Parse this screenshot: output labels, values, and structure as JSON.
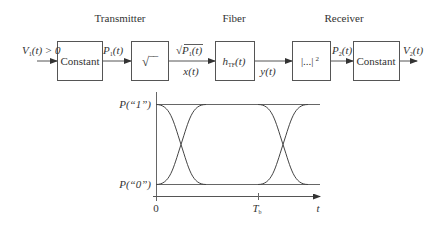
{
  "sections": {
    "transmitter": "Transmitter",
    "fiber": "Fiber",
    "receiver": "Receiver"
  },
  "blocks": [
    {
      "id": "tx-constant",
      "label": "Constant"
    },
    {
      "id": "sqrt",
      "label": "√‾‾"
    },
    {
      "id": "fiber-response",
      "label_main": "h",
      "label_sub": "TF",
      "label_arg": "(t)"
    },
    {
      "id": "square-law",
      "label": "|...|",
      "label_sup": "2"
    },
    {
      "id": "rx-constant",
      "label": "Constant"
    }
  ],
  "signals": {
    "input": {
      "main": "V",
      "sub": "1",
      "rest": "(t) > 0"
    },
    "p1": {
      "main": "P",
      "sub": "1",
      "rest": "(t)"
    },
    "sqrt_p1": {
      "prefix": "√",
      "main": "P",
      "sub": "1",
      "rest": "(t)"
    },
    "x": "x(t)",
    "y": "y(t)",
    "p2": {
      "main": "P",
      "sub": "2",
      "rest": "(t)"
    },
    "output": {
      "main": "V",
      "sub": "2",
      "rest": "(t)"
    }
  },
  "eye_diagram": {
    "level_high_label": "P(“1”)",
    "level_low_label": "P(“0”)",
    "x_axis_label": "t",
    "ticks": [
      {
        "label": "0",
        "sub": ""
      },
      {
        "label": "T",
        "sub": "b"
      }
    ]
  }
}
